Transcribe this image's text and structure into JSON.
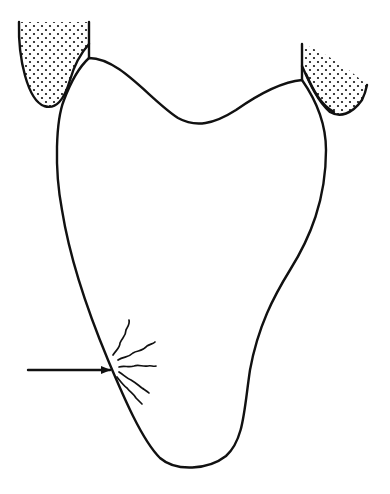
{
  "diagram": {
    "type": "line-drawing",
    "subject": "tooth-outline-with-lesion",
    "colors": {
      "background": "#ffffff",
      "ink": "#111111",
      "stipple": "#111111"
    },
    "elements": [
      {
        "id": "tooth-outline",
        "description": "Tooth crown/root outline with concave occlusal top"
      },
      {
        "id": "left-gum-tissue",
        "description": "Stippled soft tissue at upper-left margin"
      },
      {
        "id": "right-gum-tissue",
        "description": "Stippled soft tissue at upper-right margin"
      },
      {
        "id": "lesion-cracks",
        "description": "Radiating wavy crack lines on lower-left surface"
      },
      {
        "id": "pointer-arrow",
        "description": "Horizontal arrow pointing right to lesion"
      }
    ],
    "arrow": {
      "from": [
        28,
        370
      ],
      "to": [
        110,
        370
      ]
    },
    "labels": []
  }
}
